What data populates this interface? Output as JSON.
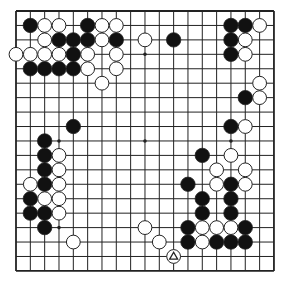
{
  "board": {
    "size": 19,
    "origin_x": 16,
    "origin_y": 11,
    "spacing_x": 14.33,
    "spacing_y": 14.44,
    "stone_radius": 7.2,
    "colors": {
      "background": "#ffffff",
      "line": "#222222",
      "black_stone": "#111111",
      "white_stone": "#ffffff",
      "stone_outline": "#222222"
    },
    "star_points": [
      [
        3,
        3
      ],
      [
        9,
        3
      ],
      [
        15,
        3
      ],
      [
        3,
        9
      ],
      [
        9,
        9
      ],
      [
        15,
        9
      ],
      [
        3,
        15
      ],
      [
        9,
        15
      ],
      [
        15,
        15
      ]
    ],
    "stones": {
      "black": [
        [
          1,
          1
        ],
        [
          5,
          1
        ],
        [
          3,
          2
        ],
        [
          4,
          2
        ],
        [
          5,
          2
        ],
        [
          7,
          2
        ],
        [
          4,
          3
        ],
        [
          1,
          4
        ],
        [
          2,
          4
        ],
        [
          3,
          4
        ],
        [
          4,
          4
        ],
        [
          11,
          2
        ],
        [
          15,
          1
        ],
        [
          16,
          1
        ],
        [
          15,
          2
        ],
        [
          15,
          3
        ],
        [
          16,
          6
        ],
        [
          15,
          8
        ],
        [
          13,
          10
        ],
        [
          12,
          12
        ],
        [
          15,
          12
        ],
        [
          13,
          13
        ],
        [
          15,
          13
        ],
        [
          13,
          14
        ],
        [
          15,
          14
        ],
        [
          12,
          15
        ],
        [
          16,
          15
        ],
        [
          12,
          16
        ],
        [
          14,
          16
        ],
        [
          15,
          16
        ],
        [
          16,
          16
        ],
        [
          4,
          8
        ],
        [
          2,
          9
        ],
        [
          2,
          10
        ],
        [
          2,
          11
        ],
        [
          2,
          12
        ],
        [
          1,
          13
        ],
        [
          1,
          14
        ],
        [
          2,
          14
        ],
        [
          2,
          15
        ]
      ],
      "white": [
        [
          2,
          1
        ],
        [
          3,
          1
        ],
        [
          6,
          1
        ],
        [
          7,
          1
        ],
        [
          2,
          2
        ],
        [
          6,
          2
        ],
        [
          0,
          3
        ],
        [
          1,
          3
        ],
        [
          2,
          3
        ],
        [
          3,
          3
        ],
        [
          5,
          3
        ],
        [
          7,
          3
        ],
        [
          5,
          4
        ],
        [
          7,
          4
        ],
        [
          6,
          5
        ],
        [
          9,
          2
        ],
        [
          17,
          1
        ],
        [
          16,
          2
        ],
        [
          16,
          3
        ],
        [
          17,
          5
        ],
        [
          17,
          6
        ],
        [
          16,
          8
        ],
        [
          15,
          10
        ],
        [
          14,
          11
        ],
        [
          16,
          11
        ],
        [
          14,
          12
        ],
        [
          16,
          12
        ],
        [
          13,
          15
        ],
        [
          14,
          15
        ],
        [
          15,
          15
        ],
        [
          13,
          16
        ],
        [
          9,
          15
        ],
        [
          10,
          16
        ],
        [
          11,
          17
        ],
        [
          3,
          10
        ],
        [
          3,
          11
        ],
        [
          1,
          12
        ],
        [
          3,
          12
        ],
        [
          2,
          13
        ],
        [
          3,
          13
        ],
        [
          3,
          14
        ],
        [
          4,
          16
        ]
      ]
    },
    "last_move_marker": {
      "col": 11,
      "row": 17,
      "shape": "triangle",
      "stone_color": "white"
    }
  }
}
